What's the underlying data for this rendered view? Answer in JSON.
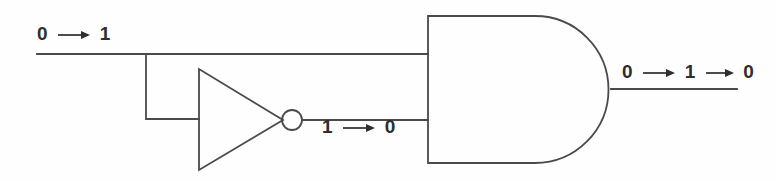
{
  "diagram": {
    "background_color": "#fefefe",
    "line_color": "#4a4a4a",
    "text_color": "#2e2e2e",
    "labels": {
      "input": {
        "from": "0",
        "to": "1",
        "text": "0 → 1"
      },
      "inverter_output": {
        "from": "1",
        "to": "0",
        "text": "1 → 0"
      },
      "gate_output": {
        "from": "0",
        "via": "1",
        "to": "0",
        "text": "0 → 1 → 0"
      }
    },
    "components": [
      {
        "name": "inverter",
        "type": "NOT gate",
        "symbol": "triangle-with-bubble"
      },
      {
        "name": "and-gate",
        "type": "AND gate",
        "symbol": "d-shape"
      }
    ],
    "wires": [
      {
        "name": "input-wire"
      },
      {
        "name": "branch-wire"
      },
      {
        "name": "inverter-output-wire"
      },
      {
        "name": "gate-output-wire"
      }
    ]
  }
}
